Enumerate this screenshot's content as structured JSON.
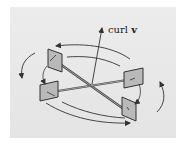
{
  "figure": {
    "label_prefix": "curl ",
    "label_vector": "v",
    "colors": {
      "background": "#e8e8e8",
      "paddle_fill": "#b8b8b8",
      "stroke": "#3a3a3a"
    }
  }
}
